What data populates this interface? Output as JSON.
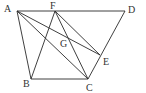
{
  "diagram": {
    "type": "geometry",
    "points": {
      "A": {
        "label": "A",
        "x": 17,
        "y": 11,
        "lx": 4,
        "ly": 12
      },
      "F": {
        "label": "F",
        "x": 55,
        "y": 11,
        "lx": 50,
        "ly": 9
      },
      "D": {
        "label": "D",
        "x": 125,
        "y": 11,
        "lx": 128,
        "ly": 13
      },
      "G": {
        "label": "G",
        "x": 67,
        "y": 41,
        "lx": 60,
        "ly": 47
      },
      "E": {
        "label": "E",
        "x": 100,
        "y": 55,
        "lx": 103,
        "ly": 65
      },
      "B": {
        "label": "B",
        "x": 31,
        "y": 79,
        "lx": 23,
        "ly": 87
      },
      "C": {
        "label": "C",
        "x": 88,
        "y": 79,
        "lx": 86,
        "ly": 91
      }
    },
    "segments": [
      [
        "A",
        "D"
      ],
      [
        "A",
        "B"
      ],
      [
        "B",
        "C"
      ],
      [
        "C",
        "D"
      ],
      [
        "A",
        "C"
      ],
      [
        "A",
        "E"
      ],
      [
        "F",
        "B"
      ],
      [
        "F",
        "C"
      ],
      [
        "F",
        "E"
      ]
    ],
    "labels": [
      "A",
      "F",
      "D",
      "G",
      "E",
      "B",
      "C"
    ]
  }
}
